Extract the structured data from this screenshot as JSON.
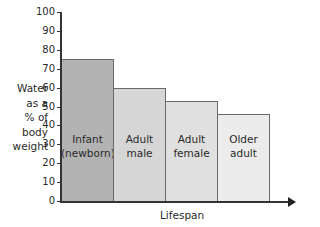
{
  "chart_data": {
    "type": "bar",
    "title": "",
    "xlabel": "Lifespan",
    "ylabel": "Water as a % of body weight",
    "ylabel_lines": [
      "Water",
      "as a",
      "% of",
      "body",
      "weight"
    ],
    "categories": [
      "Infant (newborn)",
      "Adult male",
      "Adult female",
      "Older adult"
    ],
    "category_lines": [
      [
        "Infant",
        "(newborn)"
      ],
      [
        "Adult",
        "male"
      ],
      [
        "Adult",
        "female"
      ],
      [
        "Older",
        "adult"
      ]
    ],
    "values": [
      75,
      60,
      53,
      46
    ],
    "bar_colors": [
      "#b3b3b3",
      "#d6d6d6",
      "#e0e0e0",
      "#ececec"
    ],
    "ylim": [
      0,
      100
    ],
    "yticks": [
      0,
      10,
      20,
      30,
      40,
      50,
      60,
      70,
      80,
      90,
      100
    ],
    "grid": false,
    "legend": null
  }
}
